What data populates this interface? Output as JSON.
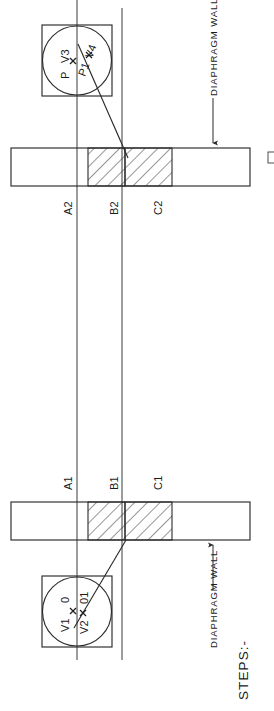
{
  "drawing": {
    "title": "STEPS:-",
    "orientation": "rotated-90-ccw",
    "annotations": {
      "steps_label": "STEPS:-",
      "wall_label_top": "DIAPHRAGM WALL",
      "wall_label_bottom": "DIAPHRAGM WALL"
    },
    "stations": {
      "top_row": [
        {
          "id": "A2",
          "label": "A2"
        },
        {
          "id": "B2",
          "label": "B2"
        },
        {
          "id": "C2",
          "label": "C2"
        }
      ],
      "bottom_row": [
        {
          "id": "A1",
          "label": "A1"
        },
        {
          "id": "B1",
          "label": "B1"
        },
        {
          "id": "C1",
          "label": "C1"
        }
      ]
    },
    "top_detail": {
      "name": "top-circle-detail",
      "points": [
        {
          "id": "P",
          "label": "P"
        },
        {
          "id": "V3",
          "label": "V3"
        },
        {
          "id": "P1",
          "label": "P1"
        },
        {
          "id": "V4",
          "label": "V4"
        }
      ]
    },
    "bottom_detail": {
      "name": "bottom-circle-detail",
      "points": [
        {
          "id": "O",
          "label": "0"
        },
        {
          "id": "V1",
          "label": "V1"
        },
        {
          "id": "O1",
          "label": "01"
        },
        {
          "id": "V2",
          "label": "V2"
        }
      ]
    },
    "colors": {
      "ink": "#2b2b2b",
      "paper": "#ffffff",
      "hatch": "#2f2f2f"
    }
  }
}
